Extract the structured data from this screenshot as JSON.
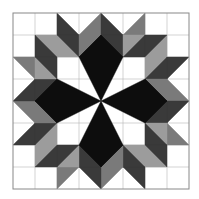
{
  "figure": {
    "kind": "quilt-block",
    "pattern_name": "pinwheel star block",
    "grid": {
      "cols": 8,
      "rows": 8,
      "origin": 13,
      "cell": 22
    },
    "colors": {
      "background": "#ffffff",
      "white": "#ffffff",
      "black": "#0d0d0d",
      "dark": "#3a3a3a",
      "mid": "#7a7a7a",
      "light": "#9c9c9c",
      "gridline": "#b5b5b5",
      "border": "#888888"
    },
    "symmetry": "4-fold rotational about center (101,101)",
    "quadrant_pieces": [
      {
        "color": "dark",
        "points": "57,13 57,35 79,35"
      },
      {
        "color": "mid",
        "points": "101,13 101,35 79,35"
      },
      {
        "color": "dark",
        "points": "101,13 101,35 123,35"
      },
      {
        "color": "mid",
        "points": "145,13 145,35 123,35"
      },
      {
        "color": "light",
        "points": "35,35 57,35 57,57"
      },
      {
        "color": "dark",
        "points": "35,35 35,57 57,57"
      },
      {
        "color": "light",
        "points": "57,35 57,57 79,57"
      },
      {
        "color": "dark",
        "points": "57,35 79,35 79,57"
      },
      {
        "color": "mid",
        "points": "79,35 101,35 79,57"
      },
      {
        "color": "black",
        "points": "101,35 101,57 79,57"
      },
      {
        "color": "dark",
        "points": "101,35 123,35 123,57"
      },
      {
        "color": "black",
        "points": "101,35 101,57 123,57"
      },
      {
        "color": "light",
        "points": "123,35 145,35 123,57"
      },
      {
        "color": "dark",
        "points": "145,35 145,57 123,57"
      },
      {
        "color": "black",
        "points": "101,35 123,57 101,101 79,57"
      }
    ]
  }
}
